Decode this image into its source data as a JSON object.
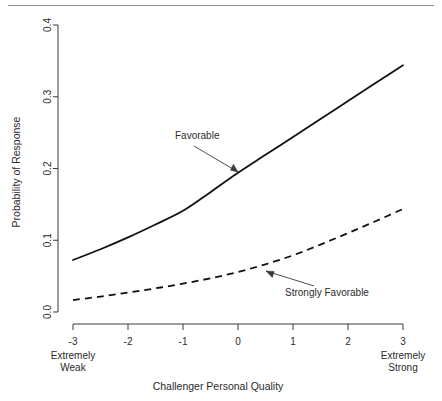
{
  "chart_data": {
    "type": "line",
    "title": "",
    "xlabel": "Challenger Personal Quality",
    "ylabel": "Probability of Response",
    "xlim": [
      -3,
      3
    ],
    "ylim": [
      0.0,
      0.4
    ],
    "x_ticks": [
      "-3",
      "-2",
      "-1",
      "0",
      "1",
      "2",
      "3"
    ],
    "x_tick_values": [
      -3,
      -2,
      -1,
      0,
      1,
      2,
      3
    ],
    "y_ticks": [
      "0.0",
      "0.1",
      "0.2",
      "0.3",
      "0.4"
    ],
    "y_tick_values": [
      0.0,
      0.1,
      0.2,
      0.3,
      0.4
    ],
    "grid": false,
    "legend_position": "inline-annotation",
    "x_axis_endcaps": {
      "left_line1": "Extremely",
      "left_line2": "Weak",
      "right_line1": "Extremely",
      "right_line2": "Strong"
    },
    "x": [
      -3,
      -2.5,
      -2,
      -1.5,
      -1,
      -0.5,
      0,
      0.5,
      1,
      1.5,
      2,
      2.5,
      3
    ],
    "series": [
      {
        "name": "Favorable",
        "style": "solid",
        "color": "#111111",
        "values": [
          0.0725,
          0.0875,
          0.104,
          0.122,
          0.141,
          0.167,
          0.194,
          0.219,
          0.244,
          0.269,
          0.294,
          0.319,
          0.344
        ]
      },
      {
        "name": "Strongly Favorable",
        "style": "dashed",
        "color": "#111111",
        "values": [
          0.0167,
          0.0215,
          0.027,
          0.033,
          0.0395,
          0.047,
          0.0558,
          0.0665,
          0.079,
          0.094,
          0.11,
          0.1265,
          0.1436
        ]
      }
    ],
    "annotations": [
      {
        "text": "Favorable",
        "target_x": 0.05,
        "target_y": 0.196
      },
      {
        "text": "Strongly Favorable",
        "target_x": 0.5,
        "target_y": 0.062
      }
    ]
  }
}
